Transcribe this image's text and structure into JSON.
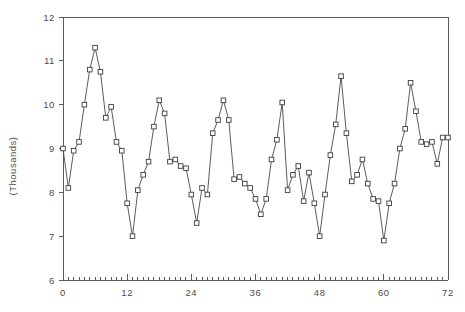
{
  "chart_data": {
    "type": "line",
    "title": "",
    "subtitle": "",
    "xlabel": "",
    "ylabel": "(Thousands)",
    "xlim": [
      0,
      72
    ],
    "ylim": [
      6,
      12
    ],
    "x_ticks": [
      0,
      12,
      24,
      36,
      48,
      60,
      72
    ],
    "y_ticks": [
      6,
      7,
      8,
      9,
      10,
      11,
      12
    ],
    "x_minor_tick_step": 1,
    "grid": false,
    "legend": null,
    "marker": "square",
    "line_color": "#4a4a4a",
    "marker_face_color": "#ffffff",
    "marker_edge_color": "#3d3d3d",
    "axis_color": "#5a5a5a",
    "background_color": "#ffffff",
    "series": [
      {
        "name": "series-1",
        "x": [
          0,
          1,
          2,
          3,
          4,
          5,
          6,
          7,
          8,
          9,
          10,
          11,
          12,
          13,
          14,
          15,
          16,
          17,
          18,
          19,
          20,
          21,
          22,
          23,
          24,
          25,
          26,
          27,
          28,
          29,
          30,
          31,
          32,
          33,
          34,
          35,
          36,
          37,
          38,
          39,
          40,
          41,
          42,
          43,
          44,
          45,
          46,
          47,
          48,
          49,
          50,
          51,
          52,
          53,
          54,
          55,
          56,
          57,
          58,
          59,
          60,
          61,
          62,
          63,
          64,
          65,
          66,
          67,
          68,
          69,
          70,
          71,
          72
        ],
        "values": [
          9.0,
          8.1,
          8.95,
          9.15,
          10.0,
          10.8,
          11.3,
          10.75,
          9.7,
          9.95,
          9.15,
          8.95,
          7.75,
          7.0,
          8.05,
          8.4,
          8.7,
          9.5,
          10.1,
          9.8,
          8.7,
          8.75,
          8.6,
          8.55,
          7.95,
          7.3,
          8.1,
          7.95,
          9.35,
          9.65,
          10.1,
          9.65,
          8.3,
          8.35,
          8.2,
          8.1,
          7.85,
          7.5,
          7.85,
          8.75,
          9.2,
          10.05,
          8.05,
          8.4,
          8.6,
          7.8,
          8.45,
          7.75,
          7.0,
          7.95,
          8.85,
          9.55,
          10.65,
          9.35,
          8.25,
          8.4,
          8.75,
          8.2,
          7.85,
          7.8,
          6.9,
          7.75,
          8.2,
          9.0,
          9.45,
          10.5,
          9.85,
          9.15,
          9.1,
          9.15,
          8.65,
          9.25,
          9.25
        ]
      }
    ]
  }
}
